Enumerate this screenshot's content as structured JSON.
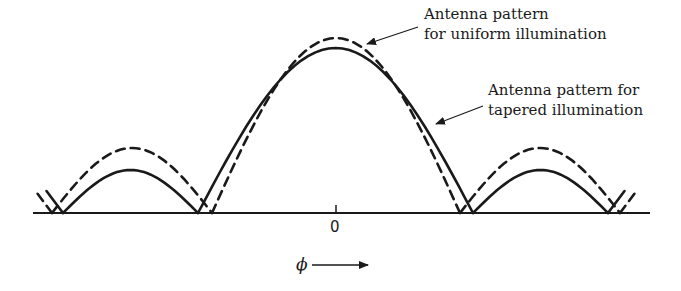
{
  "figure": {
    "type": "antenna-pattern-comparison",
    "baseline": {
      "x_start": 33,
      "x_end": 650,
      "y": 213
    },
    "center_tick": {
      "x": 336,
      "label": "0"
    },
    "axis": {
      "symbol": "ϕ",
      "arrow": "right-arrow"
    },
    "colors": {
      "line": "#1a1a1a",
      "background": "#ffffff"
    }
  },
  "labels": {
    "uniform": {
      "line1": "Antenna pattern",
      "line2": "for uniform illumination"
    },
    "tapered": {
      "line1": "Antenna pattern for",
      "line2": "tapered illumination"
    }
  },
  "series": [
    {
      "name": "uniform illumination",
      "style": "dashed",
      "main_lobe": {
        "null_left": 212,
        "null_right": 460,
        "peak_y": 38
      },
      "side_lobes": [
        {
          "null_left": 52,
          "null_right": 212,
          "peak_y": 148
        },
        {
          "null_left": 460,
          "null_right": 620,
          "peak_y": 148
        }
      ]
    },
    {
      "name": "tapered illumination",
      "style": "solid",
      "main_lobe": {
        "null_left": 198,
        "null_right": 473,
        "peak_y": 48
      },
      "side_lobes": [
        {
          "null_left": 63,
          "null_right": 198,
          "peak_y": 170
        },
        {
          "null_left": 473,
          "null_right": 608,
          "peak_y": 170
        }
      ]
    }
  ]
}
